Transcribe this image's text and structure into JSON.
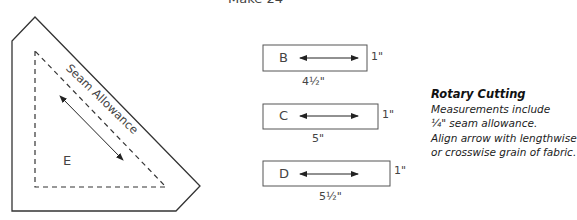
{
  "header": {
    "make_label": "Make 24"
  },
  "template_e": {
    "letter": "E",
    "seam_label": "Seam Allowance"
  },
  "pieces": [
    {
      "letter": "B",
      "width_label": "4½\"",
      "height_label": "1\""
    },
    {
      "letter": "C",
      "width_label": "5\"",
      "height_label": "1\""
    },
    {
      "letter": "D",
      "width_label": "5½\"",
      "height_label": "1\""
    }
  ],
  "notes": {
    "title": "Rotary Cutting",
    "lines": [
      "Measurements include",
      "¼\" seam allowance.",
      "Align arrow with lengthwise",
      "or crosswise grain of fabric."
    ]
  },
  "colors": {
    "line": "#333333",
    "text": "#444444"
  }
}
